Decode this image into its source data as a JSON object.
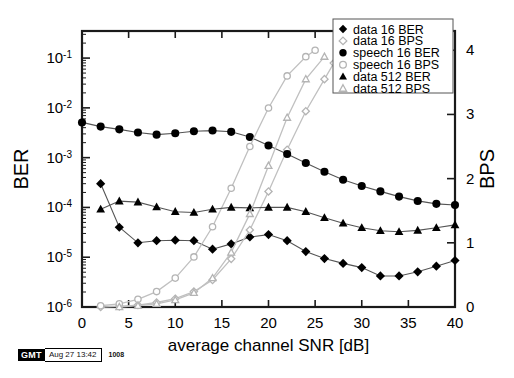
{
  "chart_data": {
    "type": "line",
    "title": "",
    "xlabel": "average channel SNR [dB]",
    "ylabel": "BER",
    "y2label": "BPS",
    "xlim": [
      0,
      40
    ],
    "xticks": [
      0,
      5,
      10,
      15,
      20,
      25,
      30,
      35,
      40
    ],
    "xticklabels": [
      "0",
      "5",
      "10",
      "15",
      "20",
      "25",
      "30",
      "35",
      "40"
    ],
    "ylim": [
      1e-06,
      0.35
    ],
    "yscale": "log",
    "yticks": [
      1e-06,
      1e-05,
      0.0001,
      0.001,
      0.01,
      0.1
    ],
    "yticklabels": [
      "10-6",
      "10-5",
      "10-4",
      "10-3",
      "10-2",
      "10-1"
    ],
    "y2lim": [
      0,
      4.3
    ],
    "y2ticks": [
      0,
      1,
      2,
      3,
      4
    ],
    "y2ticklabels": [
      "0",
      "1",
      "2",
      "3",
      "4"
    ],
    "grid": false,
    "legend_position": "upper right",
    "series": [
      {
        "name": "data 16 BER",
        "axis": "left",
        "marker": "filled-diamond",
        "x": [
          2,
          4,
          6,
          8,
          10,
          12,
          14,
          16,
          18,
          20,
          22,
          24,
          26,
          28,
          30,
          32,
          34,
          36,
          38,
          40
        ],
        "y": [
          0.0003,
          4e-05,
          1.95e-05,
          2.15e-05,
          2.2e-05,
          2.15e-05,
          1.45e-05,
          1.85e-05,
          2.55e-05,
          2.85e-05,
          2.15e-05,
          1.3e-05,
          9.4e-06,
          7.5e-06,
          6.2e-06,
          4.2e-06,
          4.2e-06,
          5.1e-06,
          6.6e-06,
          8.6e-06
        ]
      },
      {
        "name": "data 16 BPS",
        "axis": "right",
        "marker": "open-diamond",
        "x": [
          2,
          4,
          6,
          8,
          10,
          12,
          14,
          16,
          18,
          20,
          22,
          24,
          26,
          27
        ],
        "y": [
          0.0,
          0.01,
          0.03,
          0.07,
          0.13,
          0.24,
          0.42,
          0.75,
          1.2,
          1.8,
          2.45,
          3.05,
          3.55,
          3.8
        ]
      },
      {
        "name": "speech 16 BER",
        "axis": "left",
        "marker": "filled-circle",
        "x": [
          0,
          2,
          4,
          6,
          8,
          10,
          12,
          14,
          16,
          18,
          20,
          22,
          24,
          26,
          28,
          30,
          32,
          34,
          36,
          38,
          40
        ],
        "y": [
          0.0051,
          0.0042,
          0.0037,
          0.0032,
          0.0029,
          0.0031,
          0.0034,
          0.0035,
          0.0033,
          0.0026,
          0.00175,
          0.00118,
          0.00078,
          0.00052,
          0.00036,
          0.00027,
          0.00021,
          0.000165,
          0.000135,
          0.000118,
          0.000112
        ]
      },
      {
        "name": "speech 16 BPS",
        "axis": "right",
        "marker": "open-circle",
        "x": [
          2,
          4,
          6,
          8,
          10,
          12,
          14,
          16,
          18,
          20,
          22,
          24,
          25
        ],
        "y": [
          0.02,
          0.05,
          0.12,
          0.24,
          0.45,
          0.78,
          1.25,
          1.85,
          2.5,
          3.1,
          3.6,
          3.9,
          4.0
        ]
      },
      {
        "name": "data 512 BER",
        "axis": "left",
        "marker": "filled-triangle",
        "x": [
          2,
          4,
          6,
          8,
          10,
          12,
          14,
          16,
          18,
          20,
          22,
          24,
          26,
          28,
          30,
          32,
          34,
          36,
          38,
          40
        ],
        "y": [
          9.2e-05,
          0.000134,
          0.000128,
          0.000102,
          8.2e-05,
          7.9e-05,
          9.2e-05,
          0.0001,
          9.8e-05,
          0.0001,
          0.0001,
          8.2e-05,
          6.2e-05,
          4.8e-05,
          3.9e-05,
          3.4e-05,
          3.25e-05,
          3.45e-05,
          3.9e-05,
          4.45e-05
        ]
      },
      {
        "name": "data 512 BPS",
        "axis": "right",
        "marker": "open-triangle",
        "x": [
          4,
          6,
          8,
          10,
          12,
          14,
          16,
          18,
          20,
          22,
          24,
          26
        ],
        "y": [
          0.0,
          0.02,
          0.05,
          0.11,
          0.22,
          0.45,
          0.85,
          1.45,
          2.2,
          2.95,
          3.55,
          3.9
        ]
      }
    ],
    "legend": [
      {
        "label": "data 16 BER",
        "marker": "filled-diamond"
      },
      {
        "label": "data 16 BPS",
        "marker": "open-diamond"
      },
      {
        "label": "speech 16 BER",
        "marker": "filled-circle"
      },
      {
        "label": "speech 16 BPS",
        "marker": "open-circle"
      },
      {
        "label": "data 512 BER",
        "marker": "filled-triangle"
      },
      {
        "label": "data 512 BPS",
        "marker": "open-triangle"
      }
    ]
  },
  "footer": {
    "badge": "GMT",
    "date": "Aug 27 13:42",
    "number": "1008"
  },
  "colors": {
    "axis": "#1a1a1a",
    "marker_filled": "#000000",
    "marker_open_stroke": "#b4b4b4",
    "line_ber": "#555555",
    "line_bps": "#c0c0c0",
    "background": "#ffffff"
  }
}
